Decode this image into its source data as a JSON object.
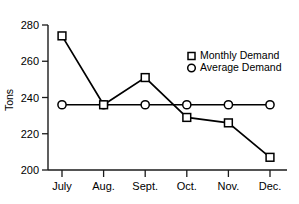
{
  "chart_data": {
    "type": "line",
    "title": "",
    "xlabel": "",
    "ylabel": "Tons",
    "categories": [
      "July",
      "Aug.",
      "Sept.",
      "Oct.",
      "Nov.",
      "Dec."
    ],
    "ylim": [
      200,
      280
    ],
    "yticks": [
      200,
      220,
      240,
      260,
      280
    ],
    "grid": false,
    "legend_position": "upper-right-inside",
    "series": [
      {
        "name": "Monthly Demand",
        "marker": "square",
        "values": [
          274,
          236,
          251,
          229,
          226,
          207
        ]
      },
      {
        "name": "Average Demand",
        "marker": "circle",
        "values": [
          236,
          236,
          236,
          236,
          236,
          236
        ]
      }
    ]
  },
  "axes": {
    "y_title": "Tons",
    "y_tick_labels": [
      "280",
      "260",
      "240",
      "220",
      "200"
    ],
    "x_tick_labels": [
      "July",
      "Aug.",
      "Sept.",
      "Oct.",
      "Nov.",
      "Dec."
    ]
  },
  "legend": {
    "items": [
      {
        "label": "Monthly Demand",
        "marker": "square-marker-icon"
      },
      {
        "label": "Average Demand",
        "marker": "circle-marker-icon"
      }
    ]
  }
}
